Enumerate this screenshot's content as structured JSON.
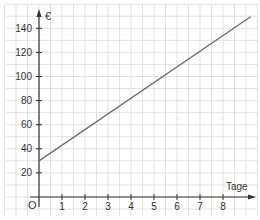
{
  "chart_data": {
    "type": "line",
    "title": "",
    "xlabel": "Tage",
    "ylabel": "€",
    "origin_label": "O",
    "x_ticks": [
      1,
      2,
      3,
      4,
      5,
      6,
      7,
      8
    ],
    "y_ticks": [
      20,
      40,
      60,
      80,
      100,
      120,
      140
    ],
    "xlim": [
      0,
      9.2
    ],
    "ylim": [
      0,
      145
    ],
    "grid": true,
    "series": [
      {
        "name": "Kosten",
        "x": [
          0,
          9.2
        ],
        "y": [
          30,
          149.6
        ],
        "intercept": 30,
        "slope": 13,
        "color": "#6e6e6e"
      }
    ]
  },
  "labels": {
    "x_axis": "Tage",
    "y_axis": "€",
    "origin": "O"
  }
}
